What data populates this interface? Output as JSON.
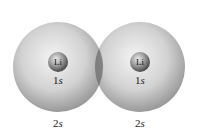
{
  "atoms": [
    {
      "symbol": "Li",
      "inner_orbital_num": "1",
      "inner_orbital_letter": "s",
      "outer_orbital_num": "2",
      "outer_orbital_letter": "s",
      "cx": 58,
      "cy": 67
    },
    {
      "symbol": "Li",
      "inner_orbital_num": "1",
      "inner_orbital_letter": "s",
      "outer_orbital_num": "2",
      "outer_orbital_letter": "s",
      "cx": 140,
      "cy": 67
    }
  ],
  "colors": {
    "sphere_light": "#f2f2f2",
    "sphere_dark": "#8a8a8a",
    "overlap": "#6e6e6e",
    "core_light": "#e8e8e8",
    "core_dark": "#3a3a3a"
  }
}
